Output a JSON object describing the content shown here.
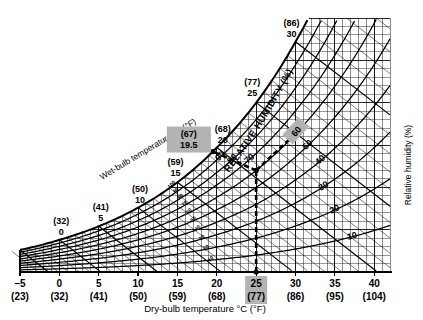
{
  "figure": {
    "type": "psychrometric-chart",
    "background": "#ffffff",
    "ink": "#000000",
    "highlight_color": "#b3b3b3"
  },
  "axes": {
    "x": {
      "title": "Dry-bulb temperature °C (°F)",
      "unit_c": "°C",
      "unit_f": "°F",
      "range_c": [
        -5,
        40
      ],
      "ticks_c": [
        -5,
        0,
        5,
        10,
        15,
        20,
        25,
        30,
        35,
        40
      ],
      "ticks_f": [
        "(23)",
        "(32)",
        "(41)",
        "(50)",
        "(59)",
        "(68)",
        "(77)",
        "(86)",
        "(95)",
        "(104)"
      ],
      "highlighted_tick": "25"
    },
    "y_right": {
      "title": "Relative humidity (%)",
      "orientation": "vertical"
    },
    "wet_bulb": {
      "title": "Wet-bulb temperature °C (°F)",
      "orientation": "diagonal",
      "labels": [
        {
          "c": "0",
          "f": "(32)"
        },
        {
          "c": "5",
          "f": "(41)"
        },
        {
          "c": "10",
          "f": "(50)"
        },
        {
          "c": "15",
          "f": "(59)"
        },
        {
          "c": "20",
          "f": "(68)"
        },
        {
          "c": "25",
          "f": "(77)"
        },
        {
          "c": "30",
          "f": "(86)"
        }
      ],
      "highlighted": {
        "c": "19.5",
        "f": "(67)"
      }
    }
  },
  "rh_band_label": "RELATIVE   HUMIDITY (%)",
  "rh_curve_labels": [
    "90",
    "80",
    "70",
    "60",
    "50",
    "40",
    "30",
    "20",
    "10"
  ],
  "rh_highlighted_label": "60",
  "rh_small_labels": [
    "100",
    "90",
    "80",
    "70",
    "60",
    "50",
    "40",
    "30",
    "20",
    "10"
  ],
  "chart_data": {
    "type": "line",
    "xlabel": "Dry-bulb temperature °C (°F)",
    "ylabel": "Relative humidity (%)",
    "xlim": [
      -5,
      42
    ],
    "ylim": [
      0,
      30
    ],
    "grid": true,
    "legend": "none",
    "x": [
      -5,
      0,
      5,
      10,
      15,
      20,
      25,
      30,
      35,
      40
    ],
    "series": [
      {
        "name": "RH 100% (saturation)",
        "rh": 100,
        "values": [
          2.6,
          3.8,
          5.4,
          7.6,
          10.6,
          14.7,
          20.0,
          27.2,
          36.6,
          49.0
        ]
      },
      {
        "name": "RH 90%",
        "rh": 90,
        "values": [
          2.34,
          3.42,
          4.86,
          6.84,
          9.54,
          13.23,
          18.0,
          24.48,
          32.94,
          44.1
        ]
      },
      {
        "name": "RH 80%",
        "rh": 80,
        "values": [
          2.08,
          3.04,
          4.32,
          6.08,
          8.48,
          11.76,
          16.0,
          21.76,
          29.28,
          39.2
        ]
      },
      {
        "name": "RH 70%",
        "rh": 70,
        "values": [
          1.82,
          2.66,
          3.78,
          5.32,
          7.42,
          10.29,
          14.0,
          19.04,
          25.62,
          34.3
        ]
      },
      {
        "name": "RH 60%",
        "rh": 60,
        "values": [
          1.56,
          2.28,
          3.24,
          4.56,
          6.36,
          8.82,
          12.0,
          16.32,
          21.96,
          29.4
        ]
      },
      {
        "name": "RH 50%",
        "rh": 50,
        "values": [
          1.3,
          1.9,
          2.7,
          3.8,
          5.3,
          7.35,
          10.0,
          13.6,
          18.3,
          24.5
        ]
      },
      {
        "name": "RH 40%",
        "rh": 40,
        "values": [
          1.04,
          1.52,
          2.16,
          3.04,
          4.24,
          5.88,
          8.0,
          10.88,
          14.64,
          19.6
        ]
      },
      {
        "name": "RH 30%",
        "rh": 30,
        "values": [
          0.78,
          1.14,
          1.62,
          2.28,
          3.18,
          4.41,
          6.0,
          8.16,
          10.98,
          14.7
        ]
      },
      {
        "name": "RH 20%",
        "rh": 20,
        "values": [
          0.52,
          0.76,
          1.08,
          1.52,
          2.12,
          2.94,
          4.0,
          5.44,
          7.32,
          9.8
        ]
      },
      {
        "name": "RH 10%",
        "rh": 10,
        "values": [
          0.26,
          0.38,
          0.54,
          0.76,
          1.06,
          1.47,
          2.0,
          2.72,
          3.66,
          4.9
        ]
      }
    ],
    "annotations": {
      "state_point": {
        "dry_bulb_c": "25",
        "dry_bulb_f": "(77)",
        "wet_bulb_c": "19.5",
        "wet_bulb_f": "(67)",
        "relative_humidity": "60"
      },
      "construction_lines": "dashed"
    }
  }
}
